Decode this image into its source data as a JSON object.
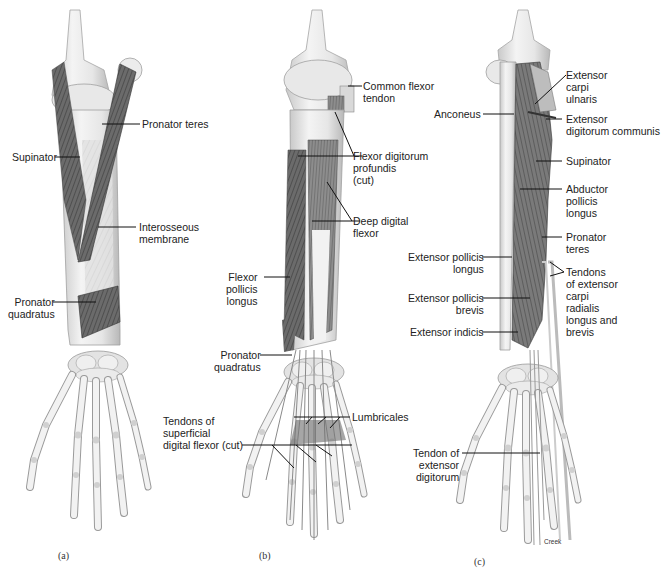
{
  "figure": {
    "panels": [
      {
        "id": "a",
        "letter": "(a)",
        "labels": [
          {
            "text": "Pronator teres"
          },
          {
            "text": "Supinator"
          },
          {
            "text": "Interosseous\nmembrane"
          },
          {
            "text": "Pronator\nquadratus"
          }
        ]
      },
      {
        "id": "b",
        "letter": "(b)",
        "labels": [
          {
            "text": "Common flexor\ntendon"
          },
          {
            "text": "Flexor digitorum\nprofundis\n(cut)"
          },
          {
            "text": "Deep digital\nflexor"
          },
          {
            "text": "Flexor\npollicis\nlongus"
          },
          {
            "text": "Pronator\nquadratus"
          },
          {
            "text": "Lumbricales"
          },
          {
            "text": "Tendons of\nsuperficial\ndigital flexor (cut)"
          }
        ]
      },
      {
        "id": "c",
        "letter": "(c)",
        "labels": [
          {
            "text": "Extensor\ncarpi\nulnaris"
          },
          {
            "text": "Anconeus"
          },
          {
            "text": "Extensor\ndigitorum communis"
          },
          {
            "text": "Supinator"
          },
          {
            "text": "Abductor\npollicis\nlongus"
          },
          {
            "text": "Pronator\nteres"
          },
          {
            "text": "Extensor pollicis\nlongus"
          },
          {
            "text": "Tendons\nof extensor\ncarpi\nradialis\nlongus and\nbrevis"
          },
          {
            "text": "Extensor pollicis\nbrevis"
          },
          {
            "text": "Extensor indicis"
          },
          {
            "text": "Tendon of\nextensor\ndigitorum"
          }
        ],
        "credit": "Creek"
      }
    ]
  },
  "colors": {
    "background": "#ffffff",
    "bone": "#ececec",
    "bone_shadow": "#bdbdbd",
    "muscle_dark": "#5a5a5a",
    "muscle_mid": "#8a8a8a",
    "leader": "#111111"
  }
}
